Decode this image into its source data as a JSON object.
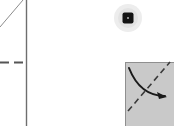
{
  "canvas": {
    "width": 174,
    "height": 126,
    "background_color": "#ffffff",
    "label": "diagram-crop"
  },
  "colors": {
    "background": "#ffffff",
    "line_gray": "#8c8c8c",
    "divider_gray": "#6e6e6e",
    "dash_gray": "#555555",
    "panel_fill": "#c9c9c9",
    "panel_stroke": "#8f8f8f",
    "halo_gray": "#ededed",
    "marker_dark": "#141414",
    "marker_inner": "#8a8a8a",
    "arrow_black": "#1a1a1a"
  },
  "elements": {
    "guide_diagonal": {
      "name": "guide-diagonal-line",
      "x1": 0,
      "y1": 27,
      "x2": 23,
      "y2": 0,
      "stroke_width": 1,
      "style": "solid"
    },
    "vertical_divider": {
      "name": "vertical-divider-line",
      "x": 26.5,
      "y1": 0,
      "y2": 126,
      "stroke_width": 1.4,
      "style": "solid"
    },
    "dashed_guide": {
      "name": "dashed-horizontal-guide",
      "x1": 0,
      "y1": 62.5,
      "x2": 26,
      "y2": 62.5,
      "stroke_width": 1.6,
      "style": "dashed",
      "dash_pattern": "9 5"
    },
    "cursor_marker": {
      "name": "cursor-highlight-marker",
      "center_x": 128,
      "center_y": 18,
      "halo_radius": 14,
      "square_size": 11,
      "square_radius": 2,
      "inner_dot_size": 2
    },
    "panel": {
      "name": "gray-panel",
      "x": 125,
      "y": 62,
      "width": 49,
      "height": 64,
      "fill": "#c9c9c9",
      "stroke_width": 1
    },
    "curved_arrow": {
      "name": "curved-arrow",
      "start_x": 129,
      "start_y": 68,
      "control_x": 140,
      "control_y": 96,
      "end_x": 167,
      "end_y": 97,
      "stroke_width": 2,
      "head_size": 7
    },
    "dashed_diagonal": {
      "name": "dashed-diagonal-line",
      "x1": 128,
      "y1": 111,
      "x2": 170,
      "y2": 62,
      "stroke_width": 1.6,
      "dash_pattern": "6 4"
    }
  }
}
